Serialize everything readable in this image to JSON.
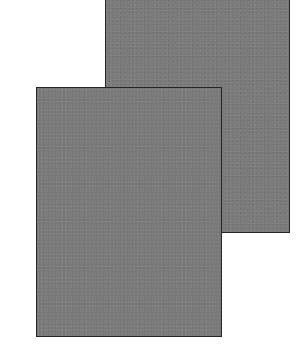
{
  "illustration": {
    "description": "Two overlapping blank gray paper sheets",
    "sheets": [
      {
        "id": "back",
        "fill": "#7b7b7b",
        "border": "#262626"
      },
      {
        "id": "front",
        "fill": "#7b7b7b",
        "border": "#262626"
      }
    ],
    "background": "#ffffff"
  }
}
